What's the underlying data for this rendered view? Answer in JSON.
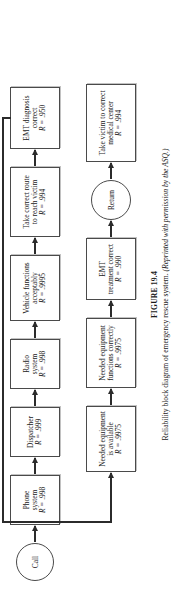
{
  "figure": {
    "caption_label": "FIGURE 19.4",
    "caption_text": "Reliability block diagram of emergency rescue system.",
    "caption_credit": "(Reprinted with permission by the ASQ.)",
    "reliability_prefix": "R ="
  },
  "chains": {
    "top": {
      "start_node": {
        "label": "Call",
        "shape": "circle"
      },
      "blocks": [
        {
          "line1": "Phone",
          "line2": "system",
          "reliability": ".998"
        },
        {
          "line1": "Dispatcher",
          "line2": "",
          "reliability": ".999"
        },
        {
          "line1": "Radio",
          "line2": "system",
          "reliability": ".998"
        },
        {
          "line1": "Vehicle functions",
          "line2": "acceptably",
          "reliability": ".9995"
        },
        {
          "line1": "Take correct route",
          "line2": "to reach victim",
          "reliability": ".994"
        },
        {
          "line1": "EMT diagnosis",
          "line2": "correct",
          "reliability": ".950"
        }
      ]
    },
    "bottom": {
      "blocks_before_return": [
        {
          "line1": "Needed equipment",
          "line2": "is available",
          "reliability": ".9975"
        },
        {
          "line1": "Needed equipment",
          "line2": "functions correctly",
          "reliability": ".9975"
        },
        {
          "line1": "EMT",
          "line2": "treatment correct",
          "reliability": ".990"
        }
      ],
      "return_node": {
        "label": "Return",
        "shape": "circle"
      },
      "blocks_after_return": [
        {
          "line1": "Take victim to correct",
          "line2": "medical center",
          "reliability": ".994"
        }
      ]
    }
  }
}
